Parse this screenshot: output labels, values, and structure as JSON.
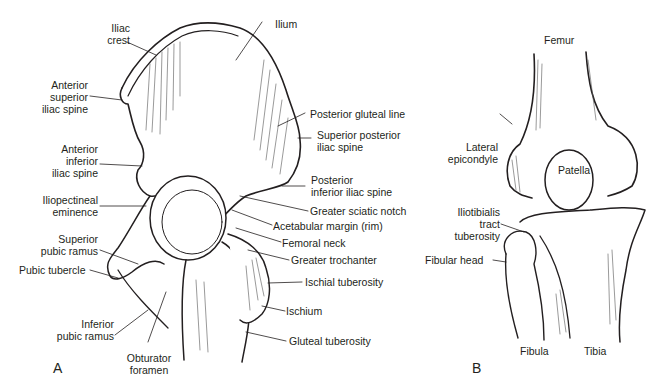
{
  "panels": {
    "a": {
      "letter": "A",
      "subject": "Hip bone and proximal femur",
      "labels": {
        "iliac_crest": "Iliac\ncrest",
        "ilium": "Ilium",
        "asis": "Anterior\nsuperior\niliac spine",
        "aiis": "Anterior\ninferior\niliac spine",
        "iliopectineal": "Iliopectineal\neminence",
        "sup_pubic_ramus": "Superior\npubic ramus",
        "pubic_tubercle": "Pubic tubercle",
        "inf_pubic_ramus": "Inferior\npubic ramus",
        "obturator": "Obturator\nforamen",
        "post_gluteal_line": "Posterior gluteal line",
        "psis": "Superior posterior\niliac spine",
        "piis": "Posterior\ninferior iliac spine",
        "sciatic_notch": "Greater sciatic notch",
        "acetabular": "Acetabular margin (rim)",
        "femoral_neck": "Femoral neck",
        "greater_troch": "Greater trochanter",
        "ischial_tub": "Ischial tuberosity",
        "ischium": "Ischium",
        "gluteal_tub": "Gluteal tuberosity"
      }
    },
    "b": {
      "letter": "B",
      "subject": "Knee (anterior view)",
      "labels": {
        "femur": "Femur",
        "lat_epicondyle": "Lateral\nepicondyle",
        "patella": "Patella",
        "it_tuberosity": "Iliotibialis\ntract\ntuberosity",
        "fibular_head": "Fibular head",
        "fibula": "Fibula",
        "tibia": "Tibia"
      }
    }
  },
  "colors": {
    "ink": "#231f20",
    "bone": "#ffffff",
    "shade": "#6d6d6d"
  }
}
